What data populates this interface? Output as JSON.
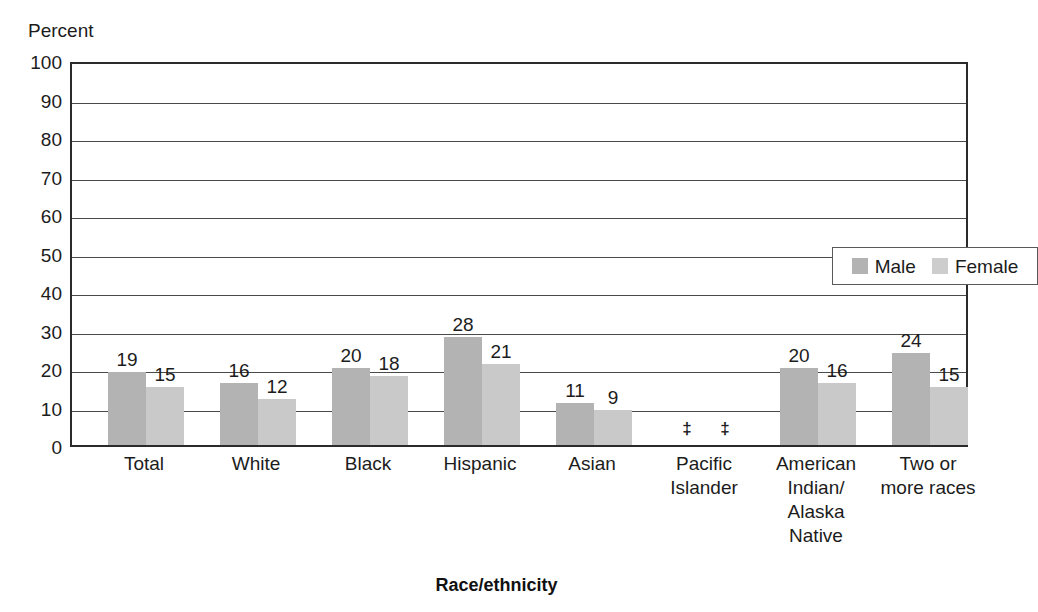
{
  "chart_data": {
    "type": "bar",
    "title": "",
    "xlabel": "Race/ethnicity",
    "ylabel": "Percent",
    "ylim": [
      0,
      100
    ],
    "ytick_step": 10,
    "yticks": [
      100,
      90,
      80,
      70,
      60,
      50,
      40,
      30,
      20,
      10,
      0
    ],
    "grid": true,
    "legend_position": "top-right",
    "categories": [
      "Total",
      "White",
      "Black",
      "Hispanic",
      "Asian",
      "Pacific Islander",
      "American Indian/ Alaska Native",
      "Two or more races"
    ],
    "category_lines": [
      [
        "Total"
      ],
      [
        "White"
      ],
      [
        "Black"
      ],
      [
        "Hispanic"
      ],
      [
        "Asian"
      ],
      [
        "Pacific",
        "Islander"
      ],
      [
        "American",
        "Indian/",
        "Alaska",
        "Native"
      ],
      [
        "Two or",
        "more races"
      ]
    ],
    "series": [
      {
        "name": "Male",
        "color": "#b3b3b3",
        "values": [
          19,
          16,
          20,
          28,
          11,
          null,
          20,
          24
        ],
        "labels": [
          "19",
          "16",
          "20",
          "28",
          "11",
          "‡",
          "20",
          "24"
        ]
      },
      {
        "name": "Female",
        "color": "#c9c9c9",
        "values": [
          15,
          12,
          18,
          21,
          9,
          null,
          16,
          15
        ],
        "labels": [
          "15",
          "12",
          "18",
          "21",
          "9",
          "‡",
          "16",
          "15"
        ]
      }
    ],
    "suppressed_symbol": "‡"
  },
  "legend": {
    "entries": [
      {
        "label": "Male"
      },
      {
        "label": "Female"
      }
    ]
  }
}
